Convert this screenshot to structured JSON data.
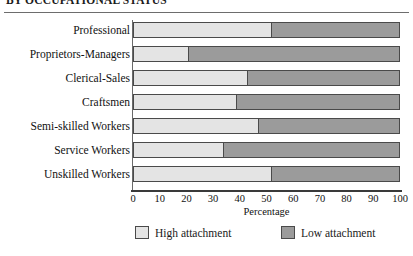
{
  "title": "BY OCCUPATIONAL STATUS",
  "chart_data": {
    "type": "bar",
    "orientation": "horizontal",
    "stacked": true,
    "stack_total": 100,
    "title": "BY OCCUPATIONAL STATUS",
    "xlabel": "Percentage",
    "ylabel": "",
    "xlim": [
      0,
      100
    ],
    "grid": false,
    "legend_position": "bottom",
    "categories": [
      "Professional",
      "Proprietors-Managers",
      "Clerical-Sales",
      "Craftsmen",
      "Semi-skilled Workers",
      "Service Workers",
      "Unskilled Workers"
    ],
    "xticks": [
      "0",
      "10",
      "20",
      "30",
      "40",
      "50",
      "60",
      "70",
      "80",
      "90",
      "100"
    ],
    "xtick_values": [
      0,
      10,
      20,
      30,
      40,
      50,
      60,
      70,
      80,
      90,
      100
    ],
    "series": [
      {
        "name": "High attachment",
        "color": "#e4e4e4",
        "values": [
          52,
          21,
          43,
          39,
          47,
          34,
          52
        ]
      },
      {
        "name": "Low attachment",
        "color": "#9b9b9b",
        "values": [
          48,
          79,
          57,
          61,
          53,
          66,
          48
        ]
      }
    ]
  },
  "legend": [
    {
      "label": "High attachment",
      "swatch": "high"
    },
    {
      "label": "Low attachment",
      "swatch": "low"
    }
  ]
}
